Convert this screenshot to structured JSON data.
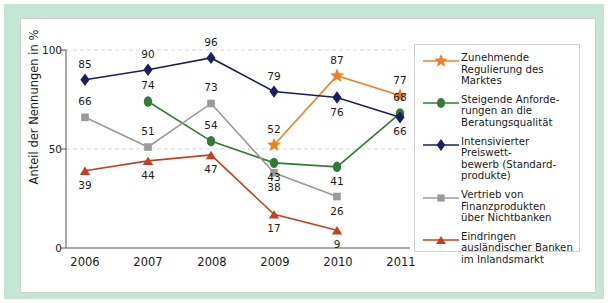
{
  "chart_data": {
    "type": "line",
    "title": "",
    "xlabel": "",
    "ylabel": "Anteil der Nennungen in %",
    "categories": [
      "2006",
      "2007",
      "2008",
      "2009",
      "2010",
      "2011"
    ],
    "ylim": [
      0,
      100
    ],
    "yticks": [
      "0",
      "50",
      "100"
    ],
    "grid": "horizontal-dashed",
    "legend_position": "right",
    "series": [
      {
        "name": "Zunehmende Regulierung des Marktes",
        "marker": "star",
        "color": "#f08020",
        "x": [
          "2009",
          "2010",
          "2011"
        ],
        "values": [
          52,
          87,
          77
        ]
      },
      {
        "name": "Steigende Anforderungen an die Beratungsqualität",
        "marker": "circle",
        "color": "#2f7d32",
        "x": [
          "2007",
          "2008",
          "2009",
          "2010",
          "2011"
        ],
        "values": [
          74,
          54,
          43,
          41,
          68
        ]
      },
      {
        "name": "Intensivierter Preiswettbewerb (Standardprodukte)",
        "marker": "diamond",
        "color": "#1b1f5e",
        "x": [
          "2006",
          "2007",
          "2008",
          "2009",
          "2010",
          "2011"
        ],
        "values": [
          85,
          90,
          96,
          79,
          76,
          66
        ]
      },
      {
        "name": "Vertrieb von Finanzprodukten über Nichtbanken",
        "marker": "square",
        "color": "#9a9a9a",
        "x": [
          "2006",
          "2007",
          "2008",
          "2009",
          "2010"
        ],
        "values": [
          66,
          51,
          73,
          38,
          26
        ]
      },
      {
        "name": "Eindringen ausländischer Banken im Inlandsmarkt",
        "marker": "triangle",
        "color": "#c63f20",
        "x": [
          "2006",
          "2007",
          "2008",
          "2009",
          "2010"
        ],
        "values": [
          39,
          44,
          47,
          17,
          9
        ]
      }
    ]
  },
  "legend": {
    "entries": [
      {
        "marker": "star-marker",
        "color": "#f08020",
        "lines": [
          "Zunehmende",
          "Regulierung des",
          "Marktes"
        ]
      },
      {
        "marker": "circle-marker",
        "color": "#2f7d32",
        "lines": [
          "Steigende Anforde-",
          "rungen an die",
          "Beratungsqualität"
        ]
      },
      {
        "marker": "diamond-marker",
        "color": "#1b1f5e",
        "lines": [
          "Intensivierter Preiswett-",
          "bewerb (Standard-",
          "produkte)"
        ]
      },
      {
        "marker": "square-marker",
        "color": "#9a9a9a",
        "lines": [
          "Vertrieb von",
          "Finanzprodukten",
          "über Nichtbanken"
        ]
      },
      {
        "marker": "triangle-marker",
        "color": "#c63f20",
        "lines": [
          "Eindringen",
          "ausländischer Banken",
          "im Inlandsmarkt"
        ]
      }
    ]
  },
  "frame": {
    "border_color": "#c5e6d4",
    "card_color": "#ffffff"
  }
}
